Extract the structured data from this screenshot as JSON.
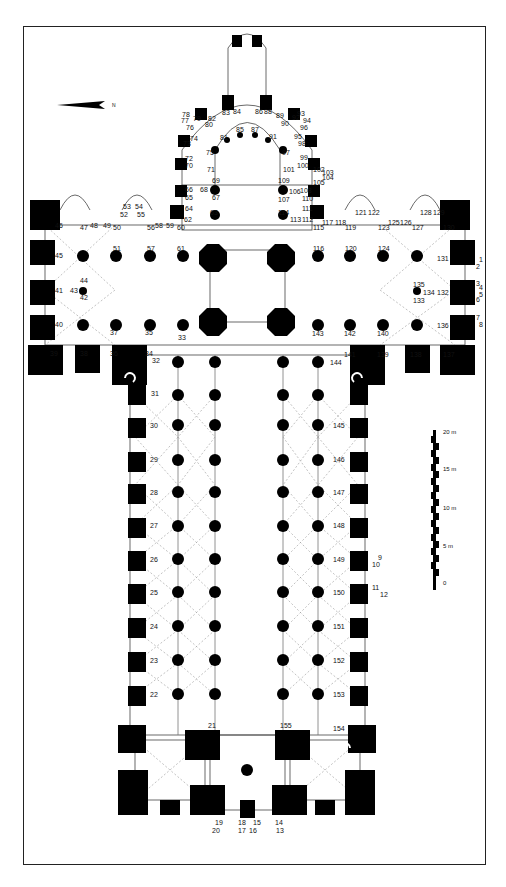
{
  "figure": {
    "type": "architectural-floor-plan",
    "north_arrow": {
      "label": "N",
      "direction": "right"
    },
    "scale_bar": {
      "unit": "m",
      "ticks": [
        {
          "value": "0",
          "label": "0"
        },
        {
          "value": "5",
          "label": "5 m"
        },
        {
          "value": "10",
          "label": "10 m"
        },
        {
          "value": "15",
          "label": "15 m"
        },
        {
          "value": "20",
          "label": "20 m"
        }
      ]
    },
    "labels": {
      "choir": [
        "62",
        "63",
        "64",
        "65",
        "66",
        "67",
        "68",
        "69",
        "70",
        "71",
        "72",
        "73",
        "74",
        "75",
        "76",
        "77",
        "78",
        "79",
        "80",
        "81",
        "82",
        "83",
        "84",
        "85",
        "86",
        "87",
        "88",
        "89",
        "90",
        "91",
        "92",
        "93",
        "94",
        "95",
        "96",
        "97",
        "98",
        "99",
        "100",
        "101",
        "102",
        "103",
        "104",
        "105",
        "106",
        "107",
        "108",
        "109",
        "110",
        "111",
        "112",
        "113",
        "114"
      ],
      "south_transept": [
        "31",
        "32",
        "33",
        "34",
        "35",
        "36",
        "37",
        "38",
        "39",
        "40",
        "41",
        "42",
        "43",
        "44",
        "45",
        "46",
        "47",
        "48",
        "49",
        "50",
        "51",
        "52",
        "53",
        "54",
        "55",
        "56",
        "57",
        "58",
        "59",
        "60",
        "61"
      ],
      "north_transept": [
        "115",
        "116",
        "117",
        "118",
        "119",
        "120",
        "121",
        "122",
        "123",
        "124",
        "125",
        "126",
        "127",
        "128",
        "129",
        "130",
        "131",
        "132",
        "133",
        "134",
        "135",
        "136",
        "137",
        "138",
        "139",
        "140",
        "141",
        "142",
        "143",
        "144"
      ],
      "nave_south": [
        "21",
        "22",
        "23",
        "24",
        "25",
        "26",
        "27",
        "28",
        "29",
        "30"
      ],
      "nave_north": [
        "145",
        "146",
        "147",
        "148",
        "149",
        "150",
        "151",
        "152",
        "153",
        "154",
        "155"
      ],
      "north_transept_portal": [
        "1",
        "2",
        "3",
        "4",
        "5",
        "6",
        "7",
        "8"
      ],
      "north_nave_portal": [
        "9",
        "10",
        "11",
        "12"
      ],
      "west_facade": [
        "13",
        "14",
        "15",
        "16",
        "17",
        "18",
        "19",
        "20"
      ]
    }
  }
}
